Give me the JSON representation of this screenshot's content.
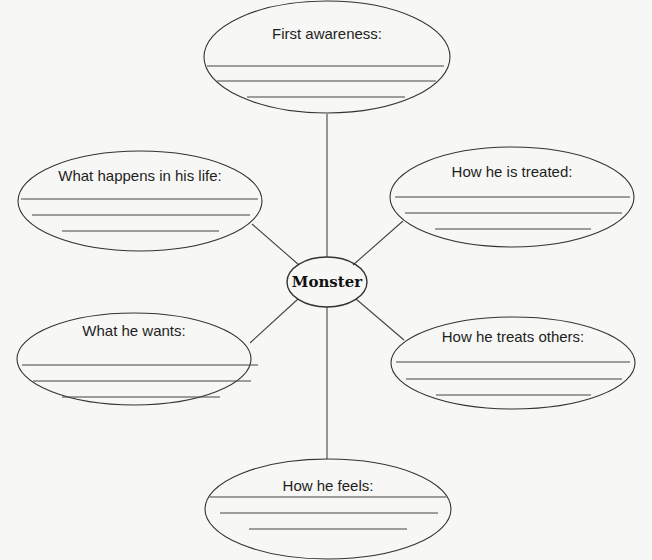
{
  "diagram": {
    "type": "character-web",
    "center": {
      "label": "Monster"
    },
    "nodes": [
      {
        "id": "top",
        "label": "First awareness:",
        "blank_lines": 3
      },
      {
        "id": "upper-left",
        "label": "What happens in his life:",
        "blank_lines": 3
      },
      {
        "id": "upper-right",
        "label": "How he is treated:",
        "blank_lines": 3
      },
      {
        "id": "lower-left",
        "label": "What he wants:",
        "blank_lines": 3
      },
      {
        "id": "lower-right",
        "label": "How he treats others:",
        "blank_lines": 3
      },
      {
        "id": "bottom",
        "label": "How he feels:",
        "blank_lines": 3
      }
    ],
    "colors": {
      "background": "#f7f7f5",
      "stroke": "#333333",
      "text": "#1e1e1e"
    }
  }
}
